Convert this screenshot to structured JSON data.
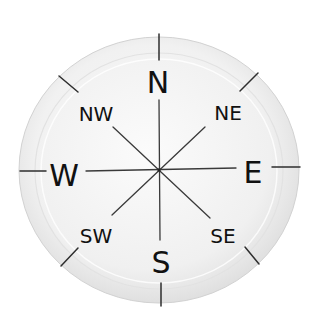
{
  "image": {
    "subject": "Paper plate compass rose",
    "background_color": "#ffffff",
    "plate_color": "#f2f2f2",
    "plate_rim_color": "#dcdcdc",
    "ink_color": "#111111"
  },
  "compass": {
    "cardinal": {
      "north": "N",
      "east": "E",
      "south": "S",
      "west": "W"
    },
    "intercardinal": {
      "northeast": "NE",
      "southeast": "SE",
      "southwest": "SW",
      "northwest": "NW"
    }
  }
}
